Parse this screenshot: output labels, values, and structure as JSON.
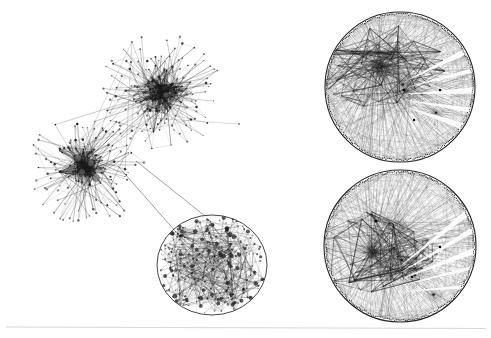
{
  "figure": {
    "title": "Network visualization figure",
    "background_color": "#ffffff",
    "ink_color": "#1a1a1a",
    "width": 491,
    "height": 338,
    "baseline_rule": {
      "name": "page-baseline-rule",
      "y": 327,
      "x1": 6,
      "x2": 486,
      "color": "#d8d8d8"
    }
  },
  "panels": [
    {
      "id": "force-directed-overview",
      "label": "force-directed graph overview",
      "type": "force-directed",
      "region": {
        "x": 8,
        "y": 6,
        "w": 300,
        "h": 320
      },
      "clusters": [
        {
          "name": "upper-right-cluster",
          "center": [
            161,
            92
          ],
          "core_radius": 32,
          "halo_radius": 62,
          "core_nodes": 120,
          "spoke_nodes": 95,
          "edge_count": 430,
          "seed": 11
        },
        {
          "name": "lower-left-cluster",
          "center": [
            87,
            168
          ],
          "core_radius": 30,
          "halo_radius": 60,
          "core_nodes": 115,
          "spoke_nodes": 90,
          "edge_count": 410,
          "seed": 29
        }
      ],
      "bridge_edges": 14,
      "stray_long_edge": {
        "from": [
          150,
          118
        ],
        "to": [
          239,
          124
        ]
      },
      "hub_nodes": [
        {
          "cx": 78,
          "cy": 158,
          "r": 3.4
        },
        {
          "cx": 91,
          "cy": 163,
          "r": 3.2
        },
        {
          "cx": 82,
          "cy": 172,
          "r": 3.0
        },
        {
          "cx": 96,
          "cy": 178,
          "r": 3.6
        },
        {
          "cx": 70,
          "cy": 170,
          "r": 2.6
        },
        {
          "cx": 166,
          "cy": 95,
          "r": 2.8
        },
        {
          "cx": 152,
          "cy": 86,
          "r": 2.4
        }
      ]
    },
    {
      "id": "magnified-detail",
      "label": "magnified detail of dense core",
      "type": "detail-ellipse",
      "ellipse": {
        "cx": 212,
        "cy": 265,
        "rx": 55,
        "ry": 50
      },
      "outline_color": "#333333",
      "node_count": 300,
      "edge_count": 620,
      "seed": 71,
      "callout_lines": [
        {
          "from": [
            118,
            166
          ],
          "to": [
            176,
            232
          ]
        },
        {
          "from": [
            136,
            161
          ],
          "to": [
            205,
            216
          ]
        }
      ]
    },
    {
      "id": "radial-top",
      "label": "hyperbolic circular layout, focus upper",
      "type": "radial-chord",
      "circle": {
        "cx": 400,
        "cy": 87,
        "r": 75
      },
      "outline_color": "#222222",
      "perimeter_nodes": 260,
      "focus": [
        378,
        66
      ],
      "secondary_focus": [
        406,
        94
      ],
      "chord_count": 520,
      "fan_count": 120,
      "seed": 5,
      "highlight_nodes": [
        {
          "cx": 404,
          "cy": 90,
          "r": 1.6
        },
        {
          "cx": 440,
          "cy": 90,
          "r": 1.3
        },
        {
          "cx": 414,
          "cy": 120,
          "r": 1.2
        }
      ]
    },
    {
      "id": "radial-bottom",
      "label": "hyperbolic circular layout, focus lower",
      "type": "radial-chord",
      "circle": {
        "cx": 400,
        "cy": 246,
        "r": 76
      },
      "outline_color": "#222222",
      "perimeter_nodes": 260,
      "focus": [
        372,
        252
      ],
      "secondary_focus": [
        400,
        228
      ],
      "chord_count": 520,
      "fan_count": 120,
      "seed": 43,
      "highlight_nodes": [
        {
          "cx": 376,
          "cy": 221,
          "r": 1.5
        },
        {
          "cx": 440,
          "cy": 247,
          "r": 1.3
        },
        {
          "cx": 412,
          "cy": 277,
          "r": 1.2
        }
      ]
    }
  ],
  "chart_data": {
    "type": "scatter",
    "title": "",
    "xlabel": "",
    "ylabel": "",
    "series": [
      {
        "name": "force-directed overview",
        "values": [
          215,
          215,
          840
        ]
      },
      {
        "name": "magnified detail",
        "values": [
          300,
          620
        ]
      },
      {
        "name": "radial layout top",
        "values": [
          260,
          520
        ]
      },
      {
        "name": "radial layout bottom",
        "values": [
          260,
          520
        ]
      }
    ],
    "legend": []
  }
}
